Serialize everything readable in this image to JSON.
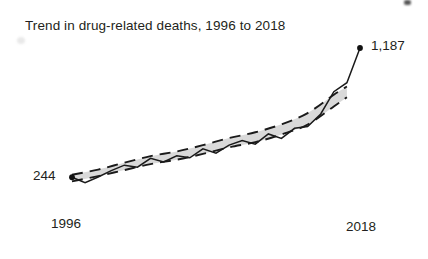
{
  "chart_data": {
    "type": "line",
    "title": "Trend in drug-related deaths, 1996 to 2018",
    "xlabel": "",
    "ylabel": "",
    "xlim": [
      1996,
      2018
    ],
    "ylim": [
      0,
      1300
    ],
    "grid": false,
    "legend": null,
    "x_tick_labels": [
      "1996",
      "2018"
    ],
    "start_label": "244",
    "end_label": "1,187",
    "annotations": [
      {
        "text": "244",
        "x": 1996,
        "y": 244,
        "position": "left"
      },
      {
        "text": "1,187",
        "x": 2018,
        "y": 1187,
        "position": "right"
      }
    ],
    "series": [
      {
        "name": "Drug-related deaths",
        "style": "solid-zigzag",
        "color": "#1a1a1a",
        "x": [
          1996,
          1997,
          1998,
          1999,
          2000,
          2001,
          2002,
          2003,
          2004,
          2005,
          2006,
          2007,
          2008,
          2009,
          2010,
          2011,
          2012,
          2013,
          2014,
          2015,
          2016,
          2017,
          2018
        ],
        "values": [
          244,
          204,
          246,
          292,
          332,
          317,
          382,
          356,
          401,
          386,
          451,
          420,
          478,
          512,
          485,
          560,
          527,
          601,
          614,
          706,
          868,
          934,
          1187
        ]
      },
      {
        "name": "Smoothed trend band",
        "style": "dashed-band",
        "fill": "#d9d9d9",
        "stroke": "#1a1a1a",
        "x": [
          1996,
          1998,
          2000,
          2002,
          2004,
          2006,
          2008,
          2010,
          2012,
          2014,
          2016,
          2017
        ],
        "upper": [
          262,
          300,
          350,
          398,
          432,
          478,
          530,
          572,
          630,
          712,
          846,
          906
        ],
        "lower": [
          214,
          252,
          296,
          340,
          372,
          414,
          462,
          500,
          556,
          628,
          760,
          828
        ]
      }
    ],
    "colors": {
      "line": "#1a1a1a",
      "band_fill": "#d9d9d9",
      "band_stroke": "#1a1a1a",
      "text": "#231f20",
      "background": "#ffffff"
    }
  }
}
